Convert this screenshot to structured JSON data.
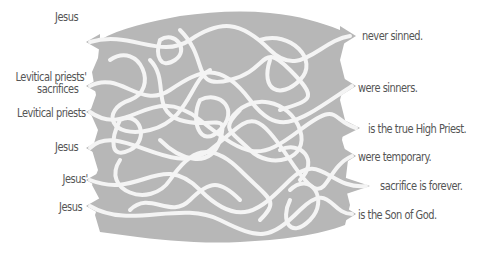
{
  "colors": {
    "maze_fill": "#b7b7b7",
    "path": "#f4f4f4",
    "text": "#555555",
    "background": "#ffffff"
  },
  "left_labels": [
    {
      "text": "Jesus",
      "line2": null
    },
    {
      "text": "Levitical priests'",
      "line2": "sacrifices"
    },
    {
      "text": "Levitical priests",
      "line2": null
    },
    {
      "text": "Jesus",
      "line2": null
    },
    {
      "text": "Jesus'",
      "line2": null
    },
    {
      "text": "Jesus",
      "line2": null
    }
  ],
  "right_labels": [
    {
      "text": "never sinned."
    },
    {
      "text": "were sinners."
    },
    {
      "text": "is the true High Priest."
    },
    {
      "text": "were temporary."
    },
    {
      "text": "sacrifice is forever."
    },
    {
      "text": "is the Son of God."
    }
  ]
}
